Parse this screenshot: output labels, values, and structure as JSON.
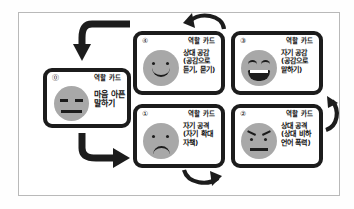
{
  "diagram": {
    "title_text": "",
    "card_header_label": "역할 카드",
    "colors": {
      "card_border": "#1c1c1c",
      "face": "#a8a8a8",
      "frame": "#b9b9b9",
      "text": "#111111"
    },
    "cards": [
      {
        "id": "start",
        "number": "⓪",
        "header": "역할 카드",
        "body": "마음 아픈\n말하기",
        "face": "neutral-face"
      },
      {
        "id": "step4",
        "number": "④",
        "header": "역할 카드",
        "body": "상대 공감\n(공감으로\n듣기, 묻기)",
        "face": "smile-face"
      },
      {
        "id": "step3",
        "number": "③",
        "header": "역할 카드",
        "body": "자기 공감\n(공감으로\n말하기)",
        "face": "laughing-face"
      },
      {
        "id": "step1",
        "number": "①",
        "header": "역할 카드",
        "body": "자기 공격\n(자기 확대\n자책)",
        "face": "sad-face"
      },
      {
        "id": "step2",
        "number": "②",
        "header": "역할 카드",
        "body": "상대 공격\n(상대 비하\n언어 폭력)",
        "face": "angry-face"
      }
    ],
    "arrows": [
      {
        "name": "arrow-into-start",
        "direction": "down-left"
      },
      {
        "name": "arrow-start-to-step1",
        "direction": "down-right"
      },
      {
        "name": "arrow-step1-to-step2",
        "direction": "right"
      },
      {
        "name": "arrow-step2-to-step3",
        "direction": "up"
      },
      {
        "name": "arrow-step3-to-step4",
        "direction": "left"
      }
    ]
  }
}
